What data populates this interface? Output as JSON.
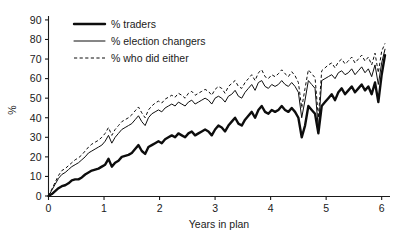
{
  "chart_data": {
    "type": "line",
    "title": "",
    "xlabel": "Years in plan",
    "ylabel": "%",
    "xlim": [
      0,
      6.15
    ],
    "ylim": [
      0,
      92
    ],
    "xticks": [
      "0",
      "1",
      "2",
      "3",
      "4",
      "5",
      "6"
    ],
    "yticks": [
      "0",
      "10",
      "20",
      "30",
      "40",
      "50",
      "60",
      "70",
      "80",
      "90"
    ],
    "grid": false,
    "legend_position": "top-left",
    "legend": [
      "% traders",
      "% election changers",
      "% who did either"
    ],
    "x": [
      0,
      0.06,
      0.12,
      0.18,
      0.24,
      0.3,
      0.36,
      0.42,
      0.48,
      0.54,
      0.6,
      0.66,
      0.72,
      0.78,
      0.84,
      0.9,
      0.96,
      1.02,
      1.08,
      1.14,
      1.2,
      1.26,
      1.32,
      1.38,
      1.44,
      1.5,
      1.56,
      1.62,
      1.68,
      1.74,
      1.8,
      1.86,
      1.92,
      1.98,
      2.04,
      2.1,
      2.16,
      2.22,
      2.28,
      2.34,
      2.4,
      2.46,
      2.52,
      2.58,
      2.64,
      2.7,
      2.76,
      2.82,
      2.88,
      2.94,
      3.0,
      3.06,
      3.12,
      3.18,
      3.24,
      3.3,
      3.36,
      3.42,
      3.48,
      3.54,
      3.6,
      3.66,
      3.72,
      3.78,
      3.84,
      3.9,
      3.96,
      4.02,
      4.08,
      4.14,
      4.2,
      4.26,
      4.32,
      4.38,
      4.44,
      4.5,
      4.56,
      4.62,
      4.68,
      4.74,
      4.8,
      4.86,
      4.92,
      4.98,
      5.04,
      5.1,
      5.16,
      5.22,
      5.28,
      5.34,
      5.4,
      5.46,
      5.52,
      5.58,
      5.64,
      5.7,
      5.76,
      5.82,
      5.88,
      5.94,
      6.0,
      6.06
    ],
    "series": [
      {
        "name": "% traders",
        "style": "thick-solid",
        "values": [
          0,
          1,
          2.5,
          4,
          5,
          5.5,
          6.5,
          8,
          8.5,
          8.5,
          9.5,
          11,
          12,
          13,
          13.5,
          14,
          15,
          16,
          19,
          15,
          17,
          18,
          20,
          20.5,
          21,
          22,
          24,
          26,
          23,
          21.5,
          25,
          26,
          27,
          28,
          27,
          29,
          30,
          31,
          30,
          32,
          31,
          30,
          32,
          33,
          31,
          32,
          33,
          34,
          33,
          31,
          34,
          36,
          35,
          33,
          36,
          38,
          40,
          37,
          36,
          39,
          41,
          43,
          40,
          44,
          46,
          43,
          42,
          44,
          43,
          44,
          46,
          44,
          43,
          45,
          43,
          40,
          30,
          36,
          46,
          44,
          42,
          32,
          46,
          48,
          50,
          52,
          49,
          53,
          55,
          52,
          54,
          56,
          53,
          55,
          57,
          54,
          56,
          52,
          58,
          48,
          62,
          72
        ]
      },
      {
        "name": "% election changers",
        "style": "thin-solid",
        "values": [
          0,
          3,
          6,
          9,
          11,
          12,
          13.5,
          15,
          16,
          17,
          18.5,
          20,
          22,
          23,
          24,
          25,
          26,
          28,
          31,
          27,
          30,
          32,
          34,
          35,
          36,
          37,
          39,
          41,
          38,
          36,
          40,
          42,
          43,
          44,
          43,
          45,
          46,
          47,
          46,
          48,
          47,
          46,
          48,
          49,
          47,
          48,
          49,
          50,
          49,
          47,
          50,
          51,
          50,
          48,
          51,
          52,
          54,
          51,
          50,
          53,
          55,
          57,
          54,
          58,
          59,
          56,
          55,
          57,
          56,
          57,
          59,
          57,
          56,
          58,
          56,
          53,
          40,
          49,
          59,
          57,
          55,
          34,
          59,
          60,
          61,
          62,
          60,
          63,
          64,
          62,
          63,
          65,
          62,
          64,
          66,
          63,
          65,
          61,
          67,
          57,
          68,
          75
        ]
      },
      {
        "name": "% who did either",
        "style": "dashed",
        "values": [
          0,
          3.5,
          7,
          10.5,
          13,
          14,
          15.5,
          17,
          18.5,
          19.5,
          21,
          23,
          25,
          26.5,
          27.5,
          28.5,
          30,
          32,
          35,
          31,
          34,
          36,
          38,
          39,
          40,
          41.5,
          43.5,
          45.5,
          42.5,
          40,
          44,
          46,
          47.5,
          48.5,
          47.5,
          49.5,
          50.5,
          51.5,
          50.5,
          52.5,
          51.5,
          50,
          52.5,
          53.5,
          51.5,
          52.5,
          53.5,
          54.5,
          53.5,
          51.5,
          54.5,
          56,
          55,
          52.5,
          56,
          57.5,
          59,
          56,
          55,
          58,
          60,
          62,
          59,
          63,
          64.5,
          61,
          60,
          62,
          61,
          62.5,
          64.5,
          62.5,
          61,
          63.5,
          61.5,
          58,
          45,
          55,
          64.5,
          62.5,
          60.5,
          40,
          64,
          65.5,
          67,
          68,
          65.5,
          68.5,
          70,
          67.5,
          69,
          71,
          68,
          70,
          72,
          69,
          71,
          67,
          73,
          63,
          74,
          78
        ]
      }
    ]
  },
  "axis": {
    "y_label": "%",
    "x_label": "Years in plan"
  }
}
